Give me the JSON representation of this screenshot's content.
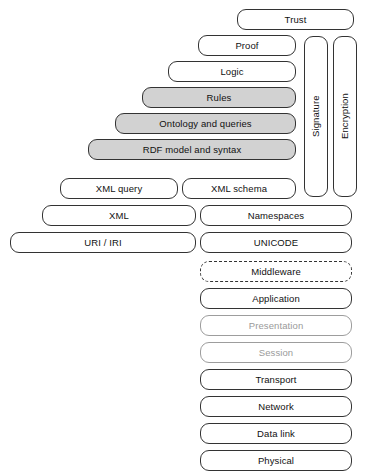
{
  "diagram": {
    "colors": {
      "shaded_fill": "#d2d2d2",
      "box_fill": "#ffffff",
      "stroke": "#333333",
      "faint_stroke": "#9d9d9d",
      "faint_text": "#9a9a9a",
      "text": "#111111",
      "background": "#ffffff"
    },
    "nodes": [
      {
        "id": "trust",
        "label": "Trust",
        "x": 237,
        "y": 9,
        "w": 117,
        "h": 21,
        "style": "plain",
        "orient": "horizontal"
      },
      {
        "id": "proof",
        "label": "Proof",
        "x": 198,
        "y": 35,
        "w": 98,
        "h": 21,
        "style": "plain",
        "orient": "horizontal"
      },
      {
        "id": "logic",
        "label": "Logic",
        "x": 168,
        "y": 61,
        "w": 128,
        "h": 21,
        "style": "plain",
        "orient": "horizontal"
      },
      {
        "id": "rules",
        "label": "Rules",
        "x": 142,
        "y": 87,
        "w": 154,
        "h": 21,
        "style": "shaded",
        "orient": "horizontal"
      },
      {
        "id": "ontology",
        "label": "Ontology and queries",
        "x": 115,
        "y": 113,
        "w": 181,
        "h": 21,
        "style": "shaded",
        "orient": "horizontal"
      },
      {
        "id": "rdf",
        "label": "RDF model and syntax",
        "x": 88,
        "y": 139,
        "w": 208,
        "h": 21,
        "style": "shaded",
        "orient": "horizontal"
      },
      {
        "id": "xmlquery",
        "label": "XML query",
        "x": 60,
        "y": 178,
        "w": 118,
        "h": 21,
        "style": "plain",
        "orient": "horizontal"
      },
      {
        "id": "xmlschema",
        "label": "XML schema",
        "x": 182,
        "y": 178,
        "w": 114,
        "h": 21,
        "style": "plain",
        "orient": "horizontal"
      },
      {
        "id": "xml",
        "label": "XML",
        "x": 42,
        "y": 205,
        "w": 154,
        "h": 21,
        "style": "plain",
        "orient": "horizontal"
      },
      {
        "id": "namespaces",
        "label": "Namespaces",
        "x": 200,
        "y": 205,
        "w": 152,
        "h": 21,
        "style": "plain",
        "orient": "horizontal"
      },
      {
        "id": "uriiri",
        "label": "URI / IRI",
        "x": 10,
        "y": 232,
        "w": 186,
        "h": 21,
        "style": "plain",
        "orient": "horizontal"
      },
      {
        "id": "unicode",
        "label": "UNICODE",
        "x": 200,
        "y": 232,
        "w": 152,
        "h": 21,
        "style": "plain",
        "orient": "horizontal"
      },
      {
        "id": "signature",
        "label": "Signature",
        "x": 304,
        "y": 36,
        "w": 24,
        "h": 161,
        "style": "plain",
        "orient": "vertical"
      },
      {
        "id": "encryption",
        "label": "Encryption",
        "x": 333,
        "y": 36,
        "w": 24,
        "h": 161,
        "style": "plain",
        "orient": "vertical"
      },
      {
        "id": "middleware",
        "label": "Middleware",
        "x": 200,
        "y": 261,
        "w": 152,
        "h": 21,
        "style": "dashed",
        "orient": "horizontal"
      },
      {
        "id": "application",
        "label": "Application",
        "x": 200,
        "y": 288,
        "w": 152,
        "h": 21,
        "style": "plain",
        "orient": "horizontal"
      },
      {
        "id": "presentation",
        "label": "Presentation",
        "x": 200,
        "y": 315,
        "w": 152,
        "h": 21,
        "style": "faint",
        "orient": "horizontal"
      },
      {
        "id": "session",
        "label": "Session",
        "x": 200,
        "y": 342,
        "w": 152,
        "h": 21,
        "style": "faint",
        "orient": "horizontal"
      },
      {
        "id": "transport",
        "label": "Transport",
        "x": 200,
        "y": 369,
        "w": 152,
        "h": 21,
        "style": "plain",
        "orient": "horizontal"
      },
      {
        "id": "network",
        "label": "Network",
        "x": 200,
        "y": 396,
        "w": 152,
        "h": 21,
        "style": "plain",
        "orient": "horizontal"
      },
      {
        "id": "datalink",
        "label": "Data link",
        "x": 200,
        "y": 423,
        "w": 152,
        "h": 21,
        "style": "plain",
        "orient": "horizontal"
      },
      {
        "id": "physical",
        "label": "Physical",
        "x": 200,
        "y": 450,
        "w": 152,
        "h": 21,
        "style": "plain",
        "orient": "horizontal"
      }
    ]
  }
}
